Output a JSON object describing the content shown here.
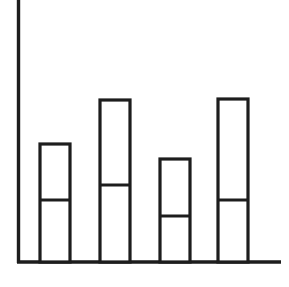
{
  "canvas": {
    "width": 289,
    "height": 287,
    "background_color": "#ffffff"
  },
  "style": {
    "line_color": "#1d1d1d",
    "axis_stroke_width": 3.4,
    "bar_stroke_width": 3.2,
    "divider_stroke_width": 3.0,
    "bar_fill_color": "#ffffff"
  },
  "axes": {
    "y_axis": {
      "x": 18.5,
      "y_top": 0,
      "y_bottom": 263
    },
    "x_axis": {
      "y": 262,
      "x_left": 17,
      "x_right": 281
    }
  },
  "chart_data": {
    "type": "bar",
    "title": "",
    "subtitle": "",
    "xlabel": "",
    "ylabel": "",
    "grid": false,
    "legend_position": "none",
    "stacked": true,
    "categories": [
      "1",
      "2",
      "3",
      "4"
    ],
    "axis_baseline_y": 262,
    "ylim": [
      0,
      262
    ],
    "series": [
      {
        "name": "lower",
        "values": [
          62,
          77,
          46,
          62
        ]
      },
      {
        "name": "upper",
        "values": [
          56,
          85,
          57,
          101
        ]
      }
    ],
    "totals": [
      118,
      162,
      103,
      163
    ],
    "bars": [
      {
        "label": "1",
        "x_left": 40,
        "x_right": 70,
        "top_y": 144,
        "divider_y": 200,
        "base_y": 262,
        "total_height": 118,
        "lower_height": 62,
        "upper_height": 56
      },
      {
        "label": "2",
        "x_left": 100,
        "x_right": 130,
        "top_y": 100,
        "divider_y": 185,
        "base_y": 262,
        "total_height": 162,
        "lower_height": 77,
        "upper_height": 85
      },
      {
        "label": "3",
        "x_left": 160,
        "x_right": 190,
        "top_y": 159,
        "divider_y": 216,
        "base_y": 262,
        "total_height": 103,
        "lower_height": 46,
        "upper_height": 57
      },
      {
        "label": "4",
        "x_left": 218,
        "x_right": 248,
        "top_y": 99,
        "divider_y": 200,
        "base_y": 262,
        "total_height": 163,
        "lower_height": 62,
        "upper_height": 101
      }
    ]
  }
}
